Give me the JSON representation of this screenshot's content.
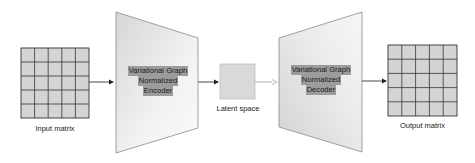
{
  "diagram": {
    "input": {
      "label": "Input matrix",
      "rows": 5,
      "cols": 5
    },
    "encoder": {
      "lines": [
        "Variational Graph",
        "Normalized",
        "Encoder"
      ]
    },
    "latent": {
      "label": "Latent space"
    },
    "decoder": {
      "lines": [
        "Variational Graph",
        "Normalized",
        "Decoder"
      ]
    },
    "output": {
      "label": "Output matrix",
      "rows": 5,
      "cols": 5
    },
    "colors": {
      "cell_fill": "#d4d4d4",
      "grid_line": "#333333",
      "block_fill_light": "#f7f7f7",
      "block_fill_dark": "#d9d9d9",
      "block_stroke": "#8a8a8a",
      "text_highlight": "#9c9c9c",
      "arrow_dark": "#333333",
      "arrow_light": "#a8a8a8"
    }
  }
}
